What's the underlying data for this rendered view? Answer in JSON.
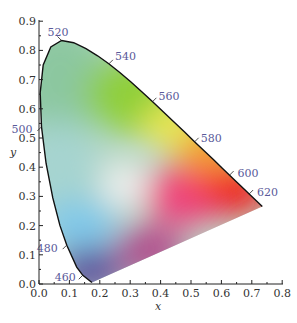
{
  "chart_data": {
    "type": "diagram",
    "xlabel": "x",
    "ylabel": "y",
    "xlim": [
      0.0,
      0.8
    ],
    "ylim": [
      0.0,
      0.9
    ],
    "x_ticks": [
      "0.0",
      "0.1",
      "0.2",
      "0.3",
      "0.4",
      "0.5",
      "0.6",
      "0.7",
      "0.8"
    ],
    "y_ticks": [
      "0.0",
      "0.1",
      "0.2",
      "0.3",
      "0.4",
      "0.5",
      "0.6",
      "0.7",
      "0.8",
      "0.9"
    ],
    "grid": false,
    "wavelength_labels": [
      {
        "nm": "460",
        "x": 0.144,
        "y": 0.03
      },
      {
        "nm": "480",
        "x": 0.091,
        "y": 0.133
      },
      {
        "nm": "500",
        "x": 0.008,
        "y": 0.538
      },
      {
        "nm": "520",
        "x": 0.074,
        "y": 0.834
      },
      {
        "nm": "540",
        "x": 0.23,
        "y": 0.754
      },
      {
        "nm": "560",
        "x": 0.373,
        "y": 0.624
      },
      {
        "nm": "580",
        "x": 0.512,
        "y": 0.487
      },
      {
        "nm": "600",
        "x": 0.627,
        "y": 0.373
      },
      {
        "nm": "620",
        "x": 0.691,
        "y": 0.308
      }
    ],
    "spectral_locus": [
      [
        0.1741,
        0.005
      ],
      [
        0.144,
        0.0297
      ],
      [
        0.1241,
        0.0578
      ],
      [
        0.0913,
        0.1327
      ],
      [
        0.0687,
        0.2007
      ],
      [
        0.0454,
        0.295
      ],
      [
        0.0235,
        0.4127
      ],
      [
        0.0082,
        0.5384
      ],
      [
        0.0039,
        0.6548
      ],
      [
        0.0139,
        0.7502
      ],
      [
        0.0389,
        0.812
      ],
      [
        0.0743,
        0.8338
      ],
      [
        0.1142,
        0.8262
      ],
      [
        0.1547,
        0.8059
      ],
      [
        0.1929,
        0.7816
      ],
      [
        0.2296,
        0.7543
      ],
      [
        0.2658,
        0.7243
      ],
      [
        0.3016,
        0.6923
      ],
      [
        0.3373,
        0.6589
      ],
      [
        0.3731,
        0.6245
      ],
      [
        0.4087,
        0.5896
      ],
      [
        0.4441,
        0.5547
      ],
      [
        0.4788,
        0.5202
      ],
      [
        0.5125,
        0.4866
      ],
      [
        0.5448,
        0.4544
      ],
      [
        0.5752,
        0.4242
      ],
      [
        0.6029,
        0.3965
      ],
      [
        0.627,
        0.3725
      ],
      [
        0.6482,
        0.3514
      ],
      [
        0.6658,
        0.334
      ],
      [
        0.6915,
        0.3083
      ],
      [
        0.7347,
        0.2653
      ]
    ],
    "line_of_purples": [
      [
        0.7347,
        0.2653
      ],
      [
        0.1741,
        0.005
      ]
    ]
  },
  "axes": {
    "x_title": "x",
    "y_title": "y"
  }
}
